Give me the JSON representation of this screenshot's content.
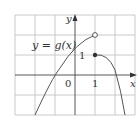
{
  "figure": {
    "function_label": "y = g(x)",
    "axis_labels": {
      "x": "x",
      "y": "y"
    },
    "tick_labels": {
      "origin": "0",
      "x_one": "1",
      "y_one": "1"
    },
    "grid": {
      "x_range": [
        -3,
        3
      ],
      "y_range": [
        -2,
        3
      ],
      "unit_px": 20
    },
    "points": [
      {
        "name": "open-circle",
        "x": 1,
        "y": 2,
        "filled": false
      },
      {
        "name": "closed-dot",
        "x": 1,
        "y": 1,
        "filled": true
      }
    ],
    "colors": {
      "grid": "#bbbbbb",
      "axis": "#333333",
      "curve": "#555555"
    }
  }
}
